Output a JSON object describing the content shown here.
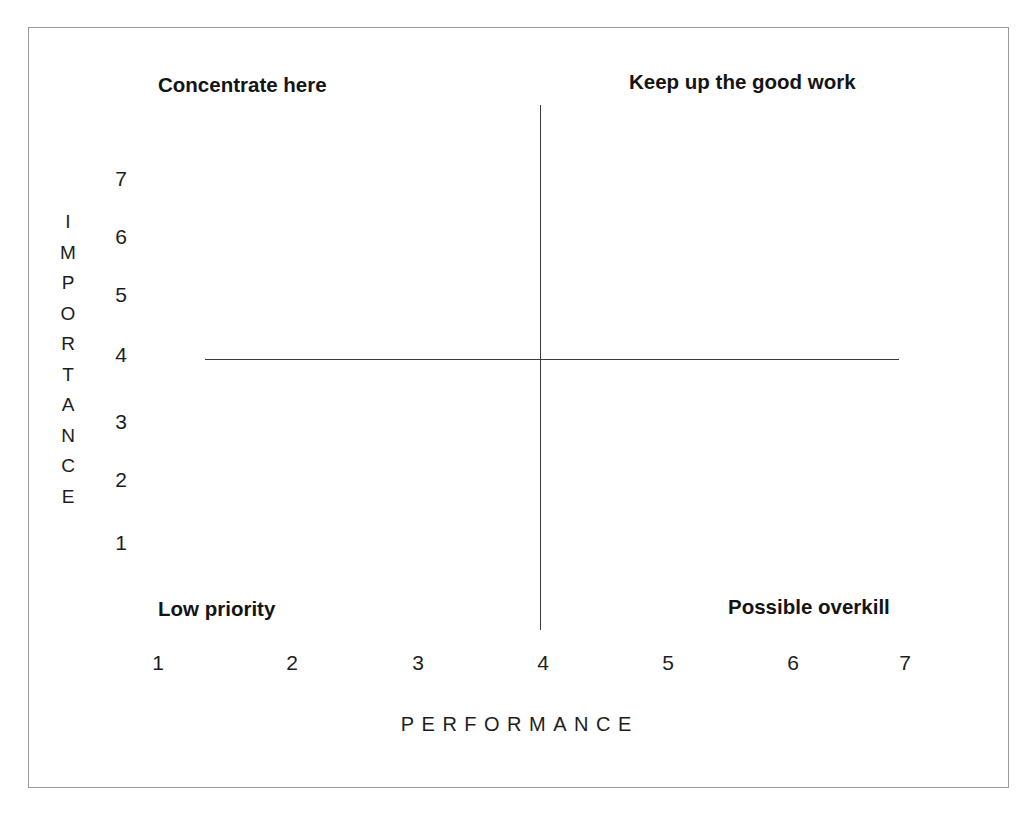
{
  "chart_data": {
    "type": "scatter",
    "title": "",
    "xlabel": "PERFORMANCE",
    "ylabel": "IMPORTANCE",
    "xlim": [
      1,
      7
    ],
    "ylim": [
      1,
      7
    ],
    "x_ticks": [
      "1",
      "2",
      "3",
      "4",
      "5",
      "6",
      "7"
    ],
    "y_ticks": [
      "7",
      "6",
      "5",
      "4",
      "3",
      "2",
      "1"
    ],
    "grid": false,
    "legend": "none",
    "series": [],
    "values": [],
    "crosshair": {
      "x": 4,
      "y": 4
    },
    "annotations": [
      {
        "id": "concentrate-here",
        "text": "Concentrate here",
        "quadrant": "top-left"
      },
      {
        "id": "keep-up-the-good-work",
        "text": "Keep up the good work",
        "quadrant": "top-right"
      },
      {
        "id": "low-priority",
        "text": "Low priority",
        "quadrant": "bottom-left"
      },
      {
        "id": "possible-overkill",
        "text": "Possible overkill",
        "quadrant": "bottom-right"
      }
    ],
    "colors": {
      "background": "#ffffff",
      "axis_line": "#3a3a3a",
      "frame": "#9a9a9a",
      "text": "#1d1d1d",
      "label_text": "#141414"
    }
  },
  "quadrants": {
    "top_left": "Concentrate here",
    "top_right": "Keep up the good work",
    "bottom_left": "Low priority",
    "bottom_right": "Possible overkill"
  },
  "y_axis": {
    "title_letters": [
      "I",
      "M",
      "P",
      "O",
      "R",
      "T",
      "A",
      "N",
      "C",
      "E"
    ],
    "ticks": [
      "7",
      "6",
      "5",
      "4",
      "3",
      "2",
      "1"
    ]
  },
  "x_axis": {
    "title": "PERFORMANCE",
    "ticks": [
      "1",
      "2",
      "3",
      "4",
      "5",
      "6",
      "7"
    ]
  }
}
